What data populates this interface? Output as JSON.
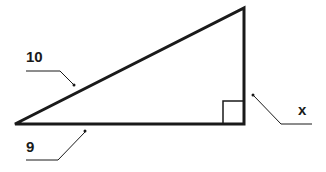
{
  "diagram": {
    "type": "right-triangle",
    "colors": {
      "stroke": "#1a1a1a",
      "background": "#ffffff"
    },
    "vertices": {
      "left": [
        15,
        124
      ],
      "top_right": [
        244,
        8
      ],
      "bottom_right": [
        244,
        124
      ]
    },
    "labels": {
      "hypotenuse": "10",
      "base": "9",
      "height": "x"
    },
    "right_angle_marker": true
  }
}
